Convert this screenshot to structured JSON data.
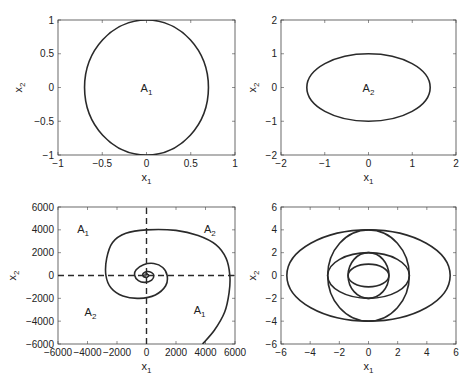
{
  "chart_data": [
    {
      "id": "top-left",
      "type": "line",
      "box": {
        "left": 58,
        "top": 20,
        "right": 235,
        "bottom": 155
      },
      "xlim": [
        -1,
        1
      ],
      "ylim": [
        -1,
        1
      ],
      "xticks": [
        -1,
        -0.5,
        0,
        0.5,
        1
      ],
      "xtick_labels": [
        "−1",
        "−0.5",
        "0",
        "0.5",
        "1"
      ],
      "yticks": [
        -1,
        -0.5,
        0,
        0.5,
        1
      ],
      "ytick_labels": [
        "−1",
        "−0.5",
        "0",
        "0.5",
        "1"
      ],
      "xlabel": "x",
      "xlabel_sub": "1",
      "ylabel": "x",
      "ylabel_sub": "2",
      "series": [
        {
          "name": "ellipse",
          "kind": "ellipse",
          "cx": 0,
          "cy": 0,
          "rx": 0.7,
          "ry": 1.0
        }
      ],
      "annotations": [
        {
          "text": "A",
          "sub": "1",
          "x": 0,
          "y": 0
        }
      ],
      "grid": false
    },
    {
      "id": "top-right",
      "type": "line",
      "box": {
        "left": 281,
        "top": 20,
        "right": 456,
        "bottom": 155
      },
      "xlim": [
        -2,
        2
      ],
      "ylim": [
        -2,
        2
      ],
      "xticks": [
        -2,
        -1,
        0,
        1,
        2
      ],
      "xtick_labels": [
        "−2",
        "−1",
        "0",
        "1",
        "2"
      ],
      "yticks": [
        -2,
        -1,
        0,
        1,
        2
      ],
      "ytick_labels": [
        "−2",
        "−1",
        "0",
        "1",
        "2"
      ],
      "xlabel": "x",
      "xlabel_sub": "1",
      "ylabel": "x",
      "ylabel_sub": "2",
      "series": [
        {
          "name": "ellipse",
          "kind": "ellipse",
          "cx": 0,
          "cy": 0,
          "rx": 1.41,
          "ry": 1.0
        }
      ],
      "annotations": [
        {
          "text": "A",
          "sub": "2",
          "x": 0,
          "y": 0
        }
      ],
      "grid": false
    },
    {
      "id": "bottom-left",
      "type": "line",
      "box": {
        "left": 58,
        "top": 207,
        "right": 235,
        "bottom": 344
      },
      "xlim": [
        -6000,
        6000
      ],
      "ylim": [
        -6000,
        6000
      ],
      "xticks": [
        -6000,
        -4000,
        -2000,
        0,
        2000,
        4000,
        6000
      ],
      "xtick_labels": [
        "−6000",
        "−4000",
        "−2000",
        "0",
        "2000",
        "4000",
        "6000"
      ],
      "yticks": [
        -6000,
        -4000,
        -2000,
        0,
        2000,
        4000,
        6000
      ],
      "ytick_labels": [
        "−6000",
        "−4000",
        "−2000",
        "0",
        "2000",
        "4000",
        "6000"
      ],
      "xlabel": "x",
      "xlabel_sub": "1",
      "ylabel": "x",
      "ylabel_sub": "2",
      "series": [
        {
          "name": "spiral-trajectory",
          "kind": "spiral",
          "points": [
            [
              3800,
              -6000
            ],
            [
              4600,
              -4800
            ],
            [
              5300,
              -3200
            ],
            [
              5600,
              -1500
            ],
            [
              5650,
              0
            ],
            [
              5400,
              1500
            ],
            [
              4700,
              2700
            ],
            [
              3500,
              3500
            ],
            [
              2000,
              3950
            ],
            [
              0,
              4000
            ],
            [
              -1400,
              3700
            ],
            [
              -2300,
              2900
            ],
            [
              -2700,
              1500
            ],
            [
              -2750,
              0
            ],
            [
              -2400,
              -1100
            ],
            [
              -1600,
              -1800
            ],
            [
              -500,
              -2000
            ],
            [
              600,
              -1700
            ],
            [
              1300,
              -900
            ],
            [
              1400,
              0
            ],
            [
              1100,
              700
            ],
            [
              500,
              1050
            ],
            [
              -200,
              950
            ],
            [
              -700,
              500
            ],
            [
              -800,
              0
            ],
            [
              -550,
              -450
            ],
            [
              -100,
              -600
            ],
            [
              350,
              -400
            ],
            [
              500,
              0
            ],
            [
              350,
              250
            ],
            [
              50,
              350
            ],
            [
              -200,
              200
            ],
            [
              -250,
              0
            ],
            [
              -120,
              -150
            ],
            [
              80,
              -120
            ],
            [
              150,
              0
            ],
            [
              60,
              80
            ],
            [
              -40,
              40
            ],
            [
              0,
              0
            ]
          ]
        },
        {
          "name": "switching-line-horizontal",
          "kind": "dashed",
          "points": [
            [
              -6000,
              0
            ],
            [
              6000,
              0
            ]
          ]
        },
        {
          "name": "switching-line-vertical",
          "kind": "dashed",
          "points": [
            [
              0,
              -6000
            ],
            [
              0,
              6000
            ]
          ]
        }
      ],
      "annotations": [
        {
          "text": "A",
          "sub": "1",
          "x": -4300,
          "y": 4100
        },
        {
          "text": "A",
          "sub": "2",
          "x": 4300,
          "y": 4100
        },
        {
          "text": "A",
          "sub": "2",
          "x": -3800,
          "y": -3200
        },
        {
          "text": "A",
          "sub": "1",
          "x": 3600,
          "y": -3000
        }
      ],
      "grid": false
    },
    {
      "id": "bottom-right",
      "type": "line",
      "box": {
        "left": 281,
        "top": 207,
        "right": 456,
        "bottom": 344
      },
      "xlim": [
        -6,
        6
      ],
      "ylim": [
        -6,
        6
      ],
      "xticks": [
        -6,
        -4,
        -2,
        0,
        2,
        4,
        6
      ],
      "xtick_labels": [
        "−6",
        "−4",
        "−2",
        "0",
        "2",
        "4",
        "6"
      ],
      "yticks": [
        -6,
        -4,
        -2,
        0,
        2,
        4,
        6
      ],
      "ytick_labels": [
        "−6",
        "−4",
        "−2",
        "0",
        "2",
        "4",
        "6"
      ],
      "xlabel": "x",
      "xlabel_sub": "1",
      "ylabel": "x",
      "ylabel_sub": "2",
      "series": [
        {
          "name": "ellipse-outer",
          "kind": "ellipse",
          "cx": 0,
          "cy": 0,
          "rx": 5.6,
          "ry": 4.0
        },
        {
          "name": "circle-large",
          "kind": "ellipse",
          "cx": 0,
          "cy": 0,
          "rx": 2.8,
          "ry": 4.0
        },
        {
          "name": "ellipse-mid",
          "kind": "ellipse",
          "cx": 0,
          "cy": 0,
          "rx": 2.8,
          "ry": 2.0
        },
        {
          "name": "circle-small",
          "kind": "ellipse",
          "cx": 0,
          "cy": 0,
          "rx": 1.4,
          "ry": 2.0
        },
        {
          "name": "ellipse-inner",
          "kind": "ellipse",
          "cx": 0,
          "cy": 0,
          "rx": 1.4,
          "ry": 1.0
        }
      ],
      "annotations": [],
      "grid": false
    }
  ],
  "style": {
    "line_color": "#2a2a2a",
    "axis_color": "#444444",
    "background": "#ffffff"
  }
}
